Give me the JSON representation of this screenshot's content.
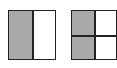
{
  "figures": [
    {
      "name": "halves-square",
      "parts": 2,
      "shaded_parts": 1,
      "division": "vertical",
      "fraction_shaded": "1/2"
    },
    {
      "name": "quarters-square",
      "parts": 4,
      "shaded_parts": 2,
      "division": "grid-2x2",
      "fraction_shaded": "2/4"
    }
  ],
  "colors": {
    "shade": "#a9a9a9",
    "border": "#222222",
    "background": "#ffffff"
  }
}
